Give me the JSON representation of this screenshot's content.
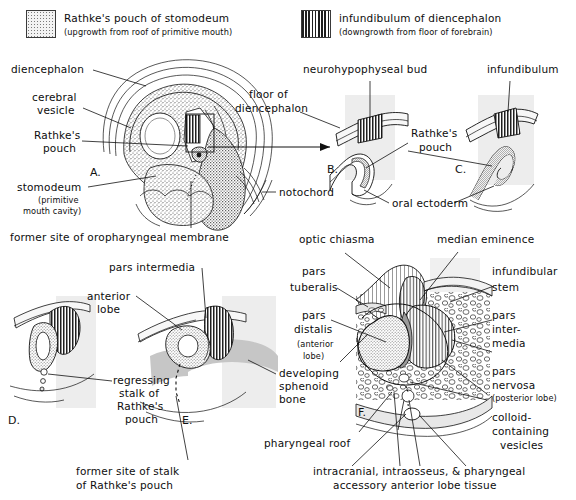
{
  "figure": {
    "colors": {
      "ink": "#111111",
      "stipple": "#8c8c8c",
      "stripe": "#2b2b2b",
      "tissue_light": "#d9d9d9",
      "tissue_mid": "#bdbdbd",
      "background": "#ffffff"
    }
  },
  "legend": {
    "items": [
      {
        "swatch": "stipple-swatch",
        "label": "Rathke's pouch of stomodeum",
        "sub": "(upgrowth from roof of primitive mouth)"
      },
      {
        "swatch": "vertical-stripe-swatch",
        "label": "infundibulum of diencephalon",
        "sub": "(downgrowth from floor of forebrain)"
      }
    ]
  },
  "panels": [
    {
      "id": "A.",
      "name": "panel-a-embryo-head"
    },
    {
      "id": "B.",
      "name": "panel-b-neurohypophyseal-bud"
    },
    {
      "id": "C.",
      "name": "panel-c-infundibulum"
    },
    {
      "id": "D.",
      "name": "panel-d-regressing-stalk"
    },
    {
      "id": "E.",
      "name": "panel-e-anterior-lobe"
    },
    {
      "id": "F.",
      "name": "panel-f-mature-pituitary"
    }
  ],
  "labels": {
    "diencephalon": "diencephalon",
    "cerebral_vesicle_l1": "cerebral",
    "cerebral_vesicle_l2": "vesicle",
    "rathkes_pouch_a_l1": "Rathke's",
    "rathkes_pouch_a_l2": "pouch",
    "stomodeum": "stomodeum",
    "stomodeum_sub_l1": "(primitive",
    "stomodeum_sub_l2": "mouth cavity)",
    "oropharyngeal": "former site of oropharyngeal membrane",
    "notochord": "notochord",
    "neurohypophyseal_bud": "neurohypophyseal bud",
    "floor_of_l1": "floor of",
    "floor_of_l2": "diencephalon",
    "rathkes_pouch_bc_l1": "Rathke's",
    "rathkes_pouch_bc_l2": "pouch",
    "infundibulum": "infundibulum",
    "oral_ectoderm": "oral ectoderm",
    "pars_intermedia_e": "pars intermedia",
    "anterior_lobe_l1": "anterior",
    "anterior_lobe_l2": "lobe",
    "regressing_l1": "regressing",
    "regressing_l2": "stalk of",
    "regressing_l3": "Rathke's",
    "regressing_l4": "pouch",
    "former_stalk_l1": "former site of stalk",
    "former_stalk_l2": "of Rathke's pouch",
    "optic_chiasma": "optic chiasma",
    "median_eminence": "median eminence",
    "pars_tuberalis_l1": "pars",
    "pars_tuberalis_l2": "tuberalis",
    "pars_distalis_l1": "pars",
    "pars_distalis_l2": "distalis",
    "pars_distalis_sub_l1": "(anterior",
    "pars_distalis_sub_l2": "lobe)",
    "developing_sphenoid_l1": "developing",
    "developing_sphenoid_l2": "sphenoid",
    "developing_sphenoid_l3": "bone",
    "infundibular_stem_l1": "infundibular",
    "infundibular_stem_l2": "stem",
    "pars_intermedia_f_l1": "pars",
    "pars_intermedia_f_l2": "inter-",
    "pars_intermedia_f_l3": "media",
    "pars_nervosa_l1": "pars",
    "pars_nervosa_l2": "nervosa",
    "pars_nervosa_sub": "(posterior lobe)",
    "colloid_l1": "colloid-",
    "colloid_l2": "containing",
    "colloid_l3": "vesicles",
    "pharyngeal_roof": "pharyngeal roof",
    "accessory_l1": "intracranial, intraosseus, & pharyngeal",
    "accessory_l2": "accessory anterior lobe tissue"
  }
}
